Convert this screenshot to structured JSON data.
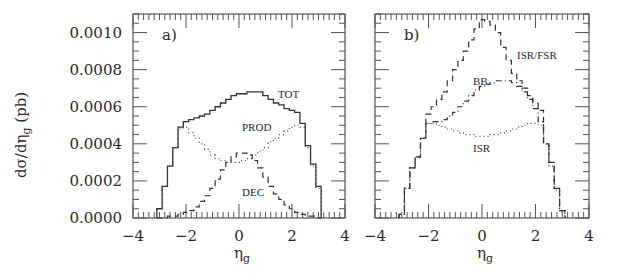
{
  "chart_data": [
    {
      "panel": "a)",
      "type": "line",
      "title": "",
      "xlabel": "η_g",
      "ylabel": "dσ/dη_g (pb)",
      "xlim": [
        -4,
        4
      ],
      "ylim": [
        0,
        0.0011
      ],
      "xticks": [
        "-4",
        "-2",
        "0",
        "2",
        "4"
      ],
      "yticks": [
        "0.0000",
        "0.0002",
        "0.0004",
        "0.0006",
        "0.0008",
        "0.0010"
      ],
      "grid": false,
      "bin_width": 0.2,
      "x": [
        -3.0,
        -2.8,
        -2.6,
        -2.4,
        -2.2,
        -2.0,
        -1.8,
        -1.6,
        -1.4,
        -1.2,
        -1.0,
        -0.8,
        -0.6,
        -0.4,
        -0.2,
        0.0,
        0.2,
        0.4,
        0.6,
        0.8,
        1.0,
        1.2,
        1.4,
        1.6,
        1.8,
        2.0,
        2.2,
        2.4,
        2.6,
        2.8,
        3.0
      ],
      "series": [
        {
          "name": "TOT",
          "style": "solid",
          "values": [
            5e-05,
            0.00017,
            0.00028,
            0.00038,
            0.00049,
            0.00052,
            0.00053,
            0.00054,
            0.00055,
            0.00056,
            0.00058,
            0.0006,
            0.00062,
            0.00064,
            0.00066,
            0.00067,
            0.00067,
            0.00068,
            0.00068,
            0.00068,
            0.00066,
            0.00064,
            0.00062,
            0.00061,
            0.00059,
            0.00058,
            0.00057,
            0.00051,
            0.00039,
            0.00029,
            0.00017
          ]
        },
        {
          "name": "PROD",
          "style": "dotted",
          "values": [
            5e-05,
            0.00017,
            0.00028,
            0.00038,
            0.00048,
            0.00049,
            0.00046,
            0.00043,
            0.0004,
            0.00037,
            0.00034,
            0.00032,
            0.00031,
            0.0003,
            0.0003,
            0.0003,
            0.00031,
            0.00032,
            0.00034,
            0.00036,
            0.00038,
            0.00041,
            0.00043,
            0.00045,
            0.00047,
            0.00049,
            0.0005,
            0.00049,
            0.00038,
            0.00028,
            0.00016
          ]
        },
        {
          "name": "DEC",
          "style": "dashed",
          "values": [
            0.0,
            0.0,
            1e-05,
            1e-05,
            2e-05,
            3e-05,
            4e-05,
            6e-05,
            9e-05,
            0.00012,
            0.00016,
            0.00021,
            0.00026,
            0.0003,
            0.00033,
            0.00035,
            0.00035,
            0.00034,
            0.00031,
            0.00027,
            0.00022,
            0.00017,
            0.00013,
            0.0001,
            7e-05,
            5e-05,
            3e-05,
            2e-05,
            1e-05,
            1e-05,
            0.0
          ]
        }
      ],
      "annotations": [
        "TOT",
        "PROD",
        "DEC"
      ]
    },
    {
      "panel": "b)",
      "type": "line",
      "title": "",
      "xlabel": "η_g",
      "ylabel": "dσ/dη_g (pb)",
      "xlim": [
        -4,
        4
      ],
      "ylim": [
        0,
        0.0011
      ],
      "xticks": [
        "-4",
        "-2",
        "0",
        "2",
        "4"
      ],
      "yticks": [
        "0.0000",
        "0.0002",
        "0.0004",
        "0.0006",
        "0.0008",
        "0.0010"
      ],
      "grid": false,
      "bin_width": 0.2,
      "x": [
        -3.0,
        -2.8,
        -2.6,
        -2.4,
        -2.2,
        -2.0,
        -1.8,
        -1.6,
        -1.4,
        -1.2,
        -1.0,
        -0.8,
        -0.6,
        -0.4,
        -0.2,
        0.0,
        0.2,
        0.4,
        0.6,
        0.8,
        1.0,
        1.2,
        1.4,
        1.6,
        1.8,
        2.0,
        2.2,
        2.4,
        2.6,
        2.8,
        3.0
      ],
      "series": [
        {
          "name": "ISR/FSR",
          "style": "dashed",
          "values": [
            2e-05,
            0.00016,
            0.00027,
            0.00033,
            0.00043,
            0.00056,
            0.0006,
            0.00064,
            0.00068,
            0.00074,
            0.0008,
            0.00085,
            0.0009,
            0.00096,
            0.00102,
            0.00107,
            0.00106,
            0.00104,
            0.001,
            0.00092,
            0.00085,
            0.00078,
            0.00074,
            0.0007,
            0.00066,
            0.00062,
            0.00058,
            0.0004,
            0.0003,
            0.00016,
            4e-05
          ]
        },
        {
          "name": "BB",
          "style": "dashdot",
          "values": [
            2e-05,
            0.00016,
            0.00027,
            0.00033,
            0.00043,
            0.00051,
            0.00052,
            0.00052,
            0.00053,
            0.00055,
            0.00057,
            0.0006,
            0.00063,
            0.00066,
            0.00069,
            0.00071,
            0.00072,
            0.00073,
            0.00074,
            0.00074,
            0.00074,
            0.00073,
            0.00071,
            0.00068,
            0.00064,
            0.00059,
            0.00052,
            0.0004,
            0.0003,
            0.00016,
            4e-05
          ]
        },
        {
          "name": "ISR",
          "style": "dotted",
          "values": [
            2e-05,
            0.00016,
            0.00027,
            0.00033,
            0.00043,
            0.00051,
            0.00051,
            0.0005,
            0.00049,
            0.00048,
            0.00047,
            0.00046,
            0.00045,
            0.00045,
            0.00044,
            0.00044,
            0.00044,
            0.00045,
            0.00045,
            0.00046,
            0.00047,
            0.00048,
            0.00049,
            0.0005,
            0.00051,
            0.00051,
            0.0005,
            0.0004,
            0.00028,
            0.00015,
            3e-05
          ]
        }
      ],
      "annotations": [
        "ISR/FSR",
        "BB",
        "ISR"
      ]
    }
  ],
  "figure": {
    "ylabel_main": "dσ/dη",
    "ylabel_sub": "g",
    "ylabel_unit": " (pb)",
    "xlabel_main": "η",
    "xlabel_sub": "g",
    "panel_a": {
      "label": "a)",
      "curve_labels": {
        "tot": "TOT",
        "prod": "PROD",
        "dec": "DEC"
      }
    },
    "panel_b": {
      "label": "b)",
      "curve_labels": {
        "isrfsr": "ISR/FSR",
        "bb": "BB",
        "isr": "ISR"
      }
    },
    "xtick_labels": [
      "−4",
      "−2",
      "0",
      "2",
      "4"
    ],
    "ytick_labels": [
      "0.0000",
      "0.0002",
      "0.0004",
      "0.0006",
      "0.0008",
      "0.0010"
    ]
  }
}
